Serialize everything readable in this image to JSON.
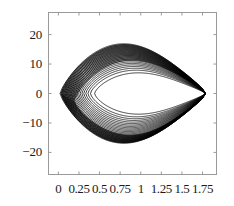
{
  "figure": {
    "background_color": "#ffffff",
    "frame_color": "#9a9a9a",
    "curve_color": "#000000"
  },
  "chart_data": {
    "type": "line",
    "title": "",
    "subtitle": "",
    "xlabel": "",
    "ylabel": "",
    "grid": false,
    "legend": null,
    "legend_position": "none",
    "frame": true,
    "xlim": [
      -0.12,
      1.92
    ],
    "ylim": [
      -27.5,
      27.5
    ],
    "xticks": [
      0,
      0.25,
      0.5,
      0.75,
      1,
      1.25,
      1.5,
      1.75
    ],
    "xticklabels": [
      "0",
      "0.25",
      "0.5",
      "0.75",
      "1",
      "1.25",
      "1.5",
      "1.75"
    ],
    "yticks": [
      -20,
      -10,
      0,
      10,
      20
    ],
    "yticklabels": [
      "-20",
      "-10",
      "0",
      "10",
      "20"
    ],
    "cusp_point": [
      1.78,
      0
    ],
    "orbit_count": 22,
    "series": [
      {
        "name": "orbit-family",
        "amplitude_min": 10.2,
        "amplitude_max": 25.4,
        "x_left_min": 0.02,
        "x_left_max": 0.44,
        "x_right": 1.78
      }
    ]
  },
  "axes": {
    "y_labels": [
      {
        "text": "20",
        "value": 20
      },
      {
        "text": "10",
        "value": 10
      },
      {
        "text": "0",
        "value": 0
      },
      {
        "text": "-10",
        "value": -10
      },
      {
        "text": "-20",
        "value": -20
      }
    ],
    "x_labels": [
      {
        "text": "0",
        "value": 0
      },
      {
        "text": "0.25",
        "value": 0.25
      },
      {
        "text": "0.5",
        "value": 0.5
      },
      {
        "text": "0.75",
        "value": 0.75
      },
      {
        "text": "1",
        "value": 1
      },
      {
        "text": "1.25",
        "value": 1.25
      },
      {
        "text": "1.5",
        "value": 1.5
      },
      {
        "text": "1.75",
        "value": 1.75
      }
    ]
  }
}
